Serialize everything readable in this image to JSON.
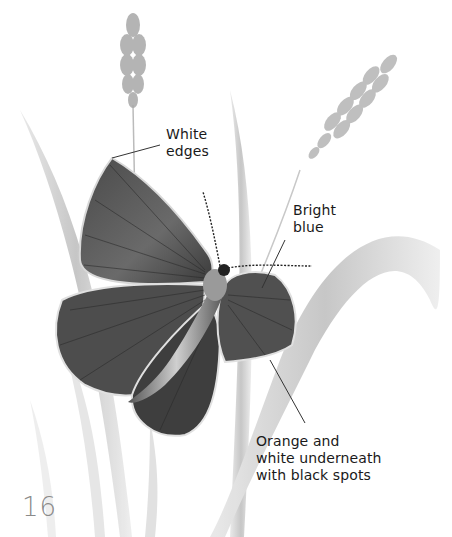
{
  "illustration": {
    "subject": "butterfly-on-grass",
    "labels": [
      {
        "id": "white-edges",
        "text": "White\nedges"
      },
      {
        "id": "bright-blue",
        "text": "Bright\nblue"
      },
      {
        "id": "underside",
        "text": "Orange and\nwhite underneath\nwith black spots"
      }
    ]
  },
  "page": {
    "number": "16"
  },
  "colors": {
    "background": "#ffffff",
    "text": "#1a1a1a",
    "wing_dark": "#2a2a2a",
    "wing_mid": "#6e6e6e",
    "grass": "#cfcfcf"
  }
}
